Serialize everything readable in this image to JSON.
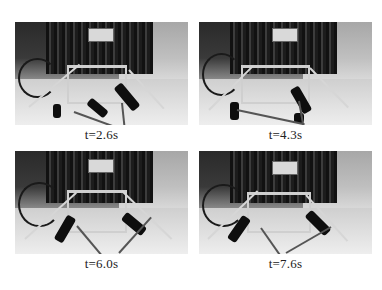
{
  "figure": {
    "layout": "2x2 grid of photo frames",
    "panels": [
      {
        "id": "panel-1",
        "label": "t=2.6s",
        "description": "Quadruped robot with aluminum frame on lab floor"
      },
      {
        "id": "panel-2",
        "label": "t=4.3s",
        "description": "Quadruped robot with aluminum frame on lab floor"
      },
      {
        "id": "panel-3",
        "label": "t=6.0s",
        "description": "Quadruped robot with aluminum frame on lab floor"
      },
      {
        "id": "panel-4",
        "label": "t=7.6s",
        "description": "Quadruped robot with aluminum frame on lab floor"
      }
    ]
  }
}
